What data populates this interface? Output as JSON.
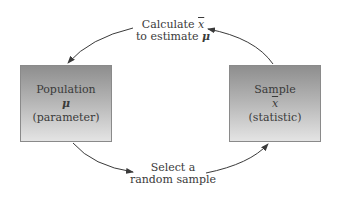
{
  "diagram": {
    "type": "cycle",
    "nodes": [
      {
        "id": "population",
        "title": "Population",
        "symbol": "μ",
        "note": "(parameter)"
      },
      {
        "id": "sample",
        "title": "Sample",
        "symbol": "x",
        "note": "(statistic)"
      }
    ],
    "edges": [
      {
        "from": "population",
        "to": "sample",
        "label_line1": "Select a",
        "label_line2": "random sample"
      },
      {
        "from": "sample",
        "to": "population",
        "label_prefix": "Calculate ",
        "label_symbol": "x",
        "label_line2_prefix": "to estimate ",
        "label_line2_symbol": "μ"
      }
    ],
    "colors": {
      "box_top": "#8e8e8e",
      "box_bottom": "#e4e4e4",
      "arrow": "#3a3a3a",
      "text": "#3a3a3a"
    }
  }
}
